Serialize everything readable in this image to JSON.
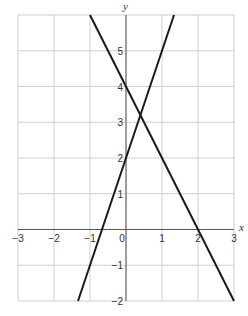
{
  "chart_data": {
    "type": "line",
    "title": "",
    "xlabel": "x",
    "ylabel": "y",
    "xlim": [
      -3,
      3
    ],
    "ylim": [
      -2,
      6
    ],
    "grid": true,
    "x_ticks": [
      "-3",
      "-2",
      "-1",
      "0",
      "1",
      "2",
      "3"
    ],
    "y_ticks": [
      "-2",
      "-1",
      "1",
      "2",
      "3",
      "4",
      "5"
    ],
    "series": [
      {
        "name": "y = -2x + 4",
        "x": [
          -1,
          3
        ],
        "y": [
          6,
          -2
        ],
        "color": "#1a1a1a"
      },
      {
        "name": "y = 3x + 2",
        "x": [
          -1.3333,
          1.3333
        ],
        "y": [
          -2,
          6
        ],
        "color": "#1a1a1a"
      }
    ],
    "annotations": []
  }
}
